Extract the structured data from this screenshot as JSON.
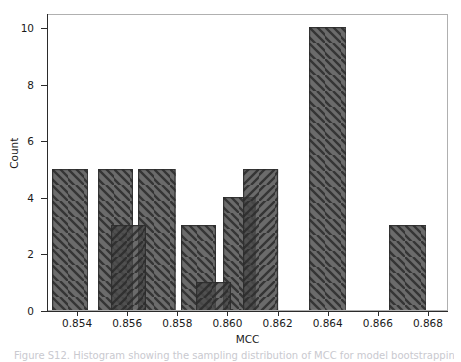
{
  "figure": {
    "caption": "Figure S12. Histogram showing the sampling distribution of MCC for model bootstrapping"
  },
  "chart_data": {
    "type": "bar",
    "title": "",
    "subtitle": "",
    "xlabel": "MCC",
    "ylabel": "Count",
    "xlim": [
      0.8528,
      0.8688
    ],
    "ylim": [
      0,
      10.5
    ],
    "xticks": [
      0.854,
      0.856,
      0.858,
      0.86,
      0.862,
      0.864,
      0.866,
      0.868
    ],
    "xtick_labels": [
      "0.854",
      "0.856",
      "0.858",
      "0.860",
      "0.862",
      "0.864",
      "0.866",
      "0.868"
    ],
    "yticks": [
      0,
      2,
      4,
      6,
      8,
      10
    ],
    "ytick_labels": [
      "0",
      "2",
      "4",
      "6",
      "8",
      "10"
    ],
    "grid": false,
    "legend": "none",
    "bin_width": 0.0016,
    "bar_fill": "#4b4b4b",
    "bar_edge": "#2b2b2b",
    "background": "#ffffff",
    "series": [
      {
        "name": "series-a",
        "hatch": "backslash",
        "bins": [
          {
            "x_left": 0.85295,
            "x_right": 0.8544,
            "value": 5
          },
          {
            "x_left": 0.8548,
            "x_right": 0.8562,
            "value": 5
          },
          {
            "x_left": 0.8564,
            "x_right": 0.8579,
            "value": 5
          },
          {
            "x_left": 0.8581,
            "x_right": 0.8595,
            "value": 3
          },
          {
            "x_left": 0.8598,
            "x_right": 0.8611,
            "value": 4
          },
          {
            "x_left": 0.8632,
            "x_right": 0.8647,
            "value": 10
          },
          {
            "x_left": 0.8664,
            "x_right": 0.8679,
            "value": 3
          }
        ]
      },
      {
        "name": "series-b",
        "hatch": "slash",
        "bins": [
          {
            "x_left": 0.8553,
            "x_right": 0.8567,
            "value": 3
          },
          {
            "x_left": 0.8587,
            "x_right": 0.8601,
            "value": 1
          },
          {
            "x_left": 0.8606,
            "x_right": 0.862,
            "value": 5
          }
        ]
      }
    ]
  }
}
